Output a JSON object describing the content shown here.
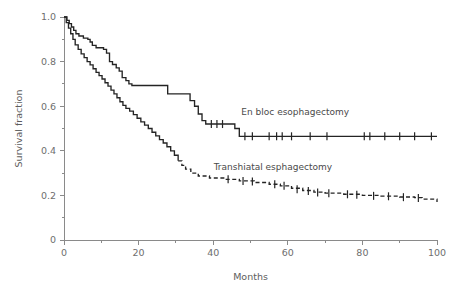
{
  "chart_data": {
    "type": "line",
    "title": "",
    "subtitle": "",
    "xlabel": "Months",
    "ylabel": "Survival fraction",
    "xlim": [
      0,
      100
    ],
    "ylim": [
      0,
      1.0
    ],
    "grid": false,
    "legend_position": "inline-annotation",
    "x_ticks": [
      0,
      20,
      40,
      60,
      80,
      100
    ],
    "x_tick_labels": [
      "0",
      "20",
      "40",
      "60",
      "80",
      "100"
    ],
    "x_minor_ticks": [
      10,
      30,
      50,
      70,
      90
    ],
    "y_ticks": [
      0,
      0.2,
      0.4,
      0.6,
      0.8,
      1.0
    ],
    "y_tick_labels": [
      "0",
      "0.2",
      "0.4",
      "0.6",
      "0.8",
      "1.0"
    ],
    "y_minor_ticks": [
      0.1,
      0.3,
      0.5,
      0.7,
      0.9
    ],
    "annotations": [
      {
        "text": "En bloc esophagectomy",
        "x": 62,
        "y": 0.56
      },
      {
        "text": "Transhiatal esphagectomy",
        "x": 56,
        "y": 0.315
      }
    ],
    "series": [
      {
        "name": "En bloc esophagectomy",
        "style": "solid",
        "curve_type": "kaplan-meier-step",
        "final_survival": 0.465,
        "points": [
          [
            0,
            1.0
          ],
          [
            0.8,
            0.985
          ],
          [
            1.4,
            0.97
          ],
          [
            2.0,
            0.955
          ],
          [
            2.6,
            0.94
          ],
          [
            3.2,
            0.925
          ],
          [
            4.0,
            0.915
          ],
          [
            5.2,
            0.905
          ],
          [
            6.4,
            0.9
          ],
          [
            7.0,
            0.888
          ],
          [
            7.6,
            0.873
          ],
          [
            8.6,
            0.862
          ],
          [
            10.6,
            0.855
          ],
          [
            11.4,
            0.838
          ],
          [
            12.2,
            0.8
          ],
          [
            13.0,
            0.787
          ],
          [
            14.0,
            0.772
          ],
          [
            14.8,
            0.757
          ],
          [
            15.6,
            0.728
          ],
          [
            16.6,
            0.715
          ],
          [
            17.4,
            0.7
          ],
          [
            18.2,
            0.693
          ],
          [
            27.0,
            0.693
          ],
          [
            27.8,
            0.655
          ],
          [
            33.0,
            0.655
          ],
          [
            33.8,
            0.625
          ],
          [
            35.0,
            0.6
          ],
          [
            36.0,
            0.565
          ],
          [
            37.0,
            0.535
          ],
          [
            38.0,
            0.52
          ],
          [
            45.0,
            0.52
          ],
          [
            45.8,
            0.5
          ],
          [
            47.0,
            0.465
          ],
          [
            100,
            0.465
          ]
        ],
        "censor_points": [
          [
            39.5,
            0.52
          ],
          [
            41.0,
            0.52
          ],
          [
            42.5,
            0.52
          ],
          [
            48.5,
            0.465
          ],
          [
            50.5,
            0.465
          ],
          [
            55.0,
            0.465
          ],
          [
            57.0,
            0.465
          ],
          [
            58.5,
            0.465
          ],
          [
            61.0,
            0.465
          ],
          [
            66.0,
            0.465
          ],
          [
            70.5,
            0.465
          ],
          [
            80.5,
            0.465
          ],
          [
            82.0,
            0.465
          ],
          [
            86.0,
            0.465
          ],
          [
            90.0,
            0.465
          ],
          [
            94.0,
            0.465
          ],
          [
            98.5,
            0.465
          ]
        ]
      },
      {
        "name": "Transhiatal esphagectomy",
        "style": "solid-then-dashed",
        "curve_type": "kaplan-meier-step",
        "dash_start_month": 31,
        "final_survival": 0.17,
        "points": [
          [
            0,
            1.0
          ],
          [
            0.6,
            0.975
          ],
          [
            1.2,
            0.95
          ],
          [
            1.8,
            0.925
          ],
          [
            2.4,
            0.9
          ],
          [
            3.0,
            0.875
          ],
          [
            3.8,
            0.855
          ],
          [
            4.6,
            0.835
          ],
          [
            5.4,
            0.818
          ],
          [
            6.2,
            0.8
          ],
          [
            7.0,
            0.785
          ],
          [
            7.8,
            0.768
          ],
          [
            8.6,
            0.752
          ],
          [
            9.4,
            0.737
          ],
          [
            10.2,
            0.722
          ],
          [
            11.0,
            0.705
          ],
          [
            11.8,
            0.69
          ],
          [
            12.6,
            0.672
          ],
          [
            13.4,
            0.655
          ],
          [
            14.2,
            0.638
          ],
          [
            15.0,
            0.62
          ],
          [
            15.8,
            0.604
          ],
          [
            16.6,
            0.59
          ],
          [
            17.6,
            0.578
          ],
          [
            18.6,
            0.562
          ],
          [
            19.6,
            0.546
          ],
          [
            20.6,
            0.53
          ],
          [
            21.6,
            0.515
          ],
          [
            22.6,
            0.5
          ],
          [
            23.6,
            0.483
          ],
          [
            24.6,
            0.467
          ],
          [
            25.6,
            0.45
          ],
          [
            26.6,
            0.435
          ],
          [
            27.6,
            0.418
          ],
          [
            28.6,
            0.4
          ],
          [
            29.6,
            0.38
          ],
          [
            30.6,
            0.355
          ],
          [
            31.6,
            0.335
          ],
          [
            32.6,
            0.318
          ],
          [
            34.0,
            0.3
          ],
          [
            36.0,
            0.287
          ],
          [
            39.0,
            0.278
          ],
          [
            43.0,
            0.272
          ],
          [
            47.0,
            0.265
          ],
          [
            51.0,
            0.258
          ],
          [
            55.0,
            0.25
          ],
          [
            58.0,
            0.243
          ],
          [
            61.0,
            0.232
          ],
          [
            64.0,
            0.222
          ],
          [
            67.0,
            0.215
          ],
          [
            70.0,
            0.21
          ],
          [
            75.0,
            0.205
          ],
          [
            80.0,
            0.2
          ],
          [
            85.0,
            0.197
          ],
          [
            90.0,
            0.193
          ],
          [
            94.0,
            0.19
          ],
          [
            96.0,
            0.183
          ],
          [
            100,
            0.17
          ]
        ],
        "censor_points": [
          [
            44.0,
            0.272
          ],
          [
            48.0,
            0.265
          ],
          [
            50.5,
            0.262
          ],
          [
            56.5,
            0.25
          ],
          [
            59.0,
            0.243
          ],
          [
            62.5,
            0.228
          ],
          [
            65.5,
            0.22
          ],
          [
            68.0,
            0.213
          ],
          [
            71.0,
            0.21
          ],
          [
            76.0,
            0.205
          ],
          [
            78.5,
            0.203
          ],
          [
            83.0,
            0.198
          ],
          [
            87.0,
            0.196
          ],
          [
            91.0,
            0.192
          ],
          [
            95.0,
            0.188
          ]
        ]
      }
    ]
  },
  "colors": {
    "curve": "#242424",
    "axis": "#8a8a8a",
    "tick_text": "#6e6e6e",
    "axis_title": "#5d5d5d",
    "label_text": "#4a4a4a",
    "background": "#ffffff"
  }
}
